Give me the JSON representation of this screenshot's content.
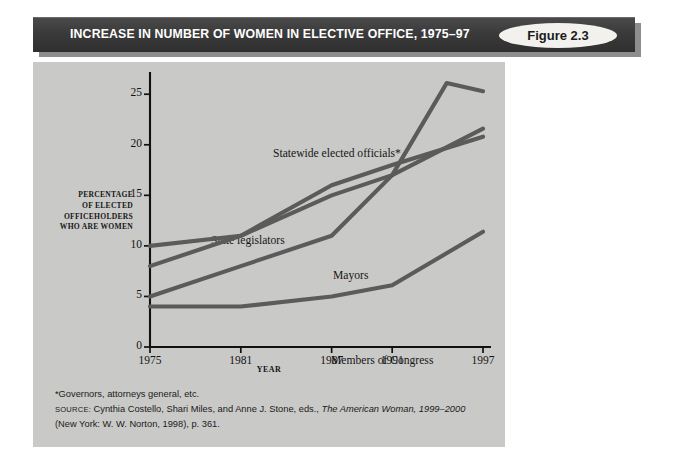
{
  "banner": {
    "title": "INCREASE IN NUMBER OF WOMEN IN ELECTIVE OFFICE, 1975–97",
    "figure_badge": "Figure 2.3",
    "bar_color": "#3d3d3d",
    "badge_color": "#f2f1ee"
  },
  "panel": {
    "background": "#c9c9c7"
  },
  "axis": {
    "ylabel_lines": [
      "PERCENTAGE",
      "OF ELECTED",
      "OFFICEHOLDERS",
      "WHO ARE WOMEN"
    ],
    "xlabel": "YEAR"
  },
  "notes": {
    "footnote": "*Governors, attorneys general, etc.",
    "source_kicker": "SOURCE:",
    "source_text_1": " Cynthia Costello, Shari Miles, and Anne J. Stone, eds., ",
    "source_italic": "The American Woman, 1999–2000",
    "source_text_2": "(New York: W. W. Norton, 1998), p. 361."
  },
  "chart_data": {
    "type": "line",
    "title": "INCREASE IN NUMBER OF WOMEN IN ELECTIVE OFFICE, 1975–97",
    "xlabel": "YEAR",
    "ylabel": "PERCENTAGE OF ELECTED OFFICEHOLDERS WHO ARE WOMEN",
    "x": [
      1975,
      1981,
      1987,
      1991,
      1997
    ],
    "xticks": [
      "1975",
      "1981",
      "1987",
      "1991",
      "1997"
    ],
    "yticks": [
      "0",
      "5",
      "10",
      "15",
      "20",
      "25"
    ],
    "ytick_values": [
      0,
      5,
      10,
      15,
      20,
      25
    ],
    "xlim": [
      1975,
      1997
    ],
    "ylim": [
      0,
      27
    ],
    "grid": false,
    "legend_position": "inline-labels",
    "line_color": "#5b5b5b",
    "series": [
      {
        "name": "Mayors",
        "label": "Mayors",
        "values": [
          10,
          11,
          16,
          18,
          20.8
        ],
        "label_x": 300,
        "label_y": 207
      },
      {
        "name": "State legislators",
        "label": "State legislators",
        "values": [
          8,
          11,
          15,
          17,
          21.6
        ],
        "label_x": 178,
        "label_y": 172
      },
      {
        "name": "Statewide elected officials",
        "label": "Statewide elected officials*",
        "values": [
          5,
          8,
          11,
          17,
          25.3
        ],
        "peak": {
          "x": 1994.6,
          "y": 26.1
        },
        "label_x": 240,
        "label_y": 85
      },
      {
        "name": "Members of Congress",
        "label": "Members of Congress",
        "values": [
          4,
          4,
          5,
          6.1,
          11.4
        ],
        "label_x": 298,
        "label_y": 292
      }
    ]
  }
}
